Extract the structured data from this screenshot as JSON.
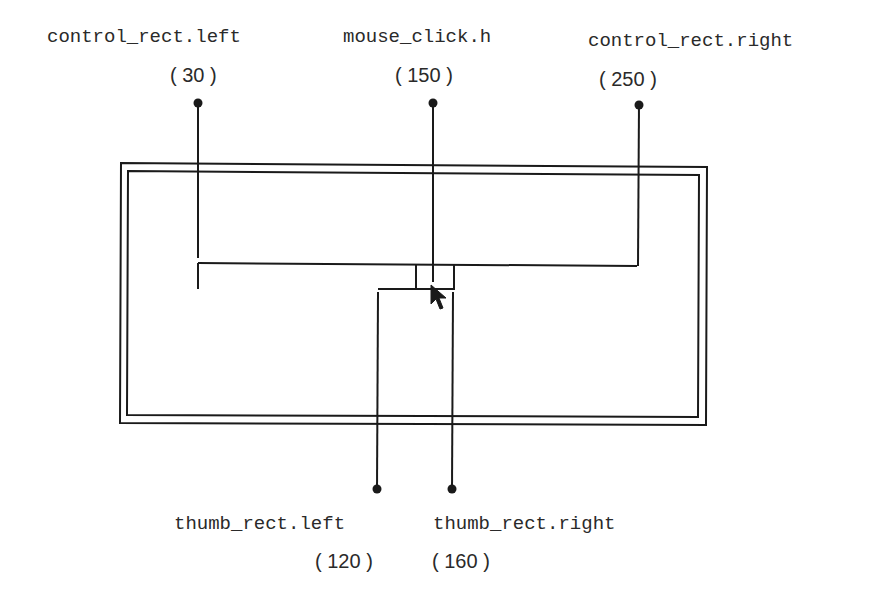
{
  "diagram": {
    "labels": {
      "control_left": {
        "name": "control_rect.left",
        "value": "( 30 )"
      },
      "mouse_click": {
        "name": "mouse_click.h",
        "value": "( 150 )"
      },
      "control_right": {
        "name": "control_rect.right",
        "value": "( 250 )"
      },
      "thumb_left": {
        "name": "thumb_rect.left",
        "value": "( 120 )"
      },
      "thumb_right": {
        "name": "thumb_rect.right",
        "value": "( 160 )"
      }
    },
    "colors": {
      "line": "#1a1a1a",
      "text": "#2a2a2a",
      "background": "#ffffff"
    }
  }
}
